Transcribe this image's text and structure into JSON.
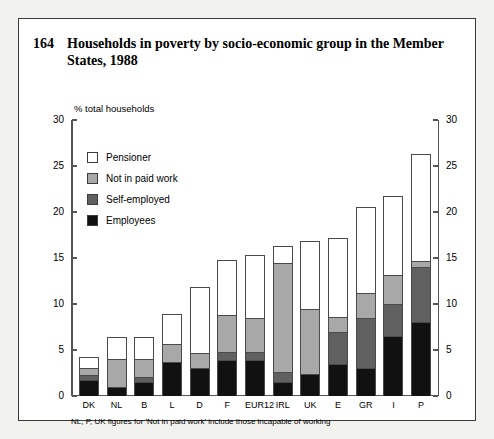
{
  "figure": {
    "number": "164",
    "title": "Households in poverty by socio-economic group in the Member States, 1988",
    "axis_label": "% total households",
    "footnote": "NL, P, UK figures for 'Not in paid work' include those incapable of working"
  },
  "colors": {
    "pensioner": "#ffffff",
    "not_in_paid_work": "#a8a8a8",
    "self_employed": "#606060",
    "employees": "#111111",
    "frame": "#3a3a3a",
    "page_background": "#f2f2ee",
    "plot_background": "#ffffff"
  },
  "chart_data": {
    "type": "bar",
    "stacked": true,
    "title": "Households in poverty by socio-economic group in the Member States, 1988",
    "xlabel": "",
    "ylabel": "% total households",
    "ylim": [
      0,
      30
    ],
    "yticks": [
      0,
      5,
      10,
      15,
      20,
      25,
      30
    ],
    "ytick_labels": [
      "0",
      "5",
      "10",
      "15",
      "20",
      "25",
      "30"
    ],
    "dual_axis": true,
    "grid": false,
    "legend_position": "upper-left-inside",
    "categories": [
      "DK",
      "NL",
      "B",
      "L",
      "D",
      "F",
      "EUR12",
      "IRL",
      "UK",
      "E",
      "GR",
      "I",
      "P"
    ],
    "series": [
      {
        "name": "Employees",
        "color": "#111111",
        "values": [
          1.7,
          1.0,
          1.5,
          3.7,
          3.0,
          3.9,
          3.9,
          1.5,
          2.4,
          3.5,
          3.0,
          6.5,
          8.0
        ]
      },
      {
        "name": "Self-employed",
        "color": "#606060",
        "values": [
          0.6,
          0.0,
          0.6,
          0.0,
          0.0,
          0.9,
          0.9,
          1.1,
          0.0,
          3.5,
          5.5,
          3.5,
          6.0
        ]
      },
      {
        "name": "Not in paid work",
        "color": "#a8a8a8",
        "values": [
          0.7,
          3.0,
          1.9,
          2.0,
          1.7,
          4.0,
          3.7,
          11.9,
          7.1,
          1.6,
          2.7,
          3.2,
          0.7
        ]
      },
      {
        "name": "Pensioner",
        "color": "#ffffff",
        "values": [
          1.2,
          2.4,
          2.4,
          3.2,
          7.2,
          6.0,
          6.8,
          1.8,
          7.3,
          8.6,
          9.4,
          8.5,
          11.6
        ]
      }
    ],
    "totals": [
      4.2,
      6.4,
      6.4,
      8.9,
      11.9,
      14.8,
      15.3,
      16.3,
      16.8,
      17.2,
      20.6,
      21.7,
      26.3
    ]
  },
  "legend": [
    {
      "label": "Pensioner",
      "color": "#ffffff"
    },
    {
      "label": "Not in paid work",
      "color": "#a8a8a8"
    },
    {
      "label": "Self-employed",
      "color": "#606060"
    },
    {
      "label": "Employees",
      "color": "#111111"
    }
  ]
}
